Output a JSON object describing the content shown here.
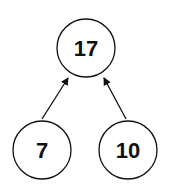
{
  "diagram": {
    "type": "tree",
    "nodes": [
      {
        "id": "root",
        "label": "17",
        "cx": 86,
        "cy": 48,
        "r": 29
      },
      {
        "id": "left",
        "label": "7",
        "cx": 42,
        "cy": 150,
        "r": 29
      },
      {
        "id": "right",
        "label": "10",
        "cx": 128,
        "cy": 150,
        "r": 29
      }
    ],
    "edges": [
      {
        "from": "left",
        "to": "root"
      },
      {
        "from": "right",
        "to": "root"
      }
    ],
    "colors": {
      "stroke": "#111111",
      "fill": "#ffffff",
      "text": "#111111"
    }
  }
}
